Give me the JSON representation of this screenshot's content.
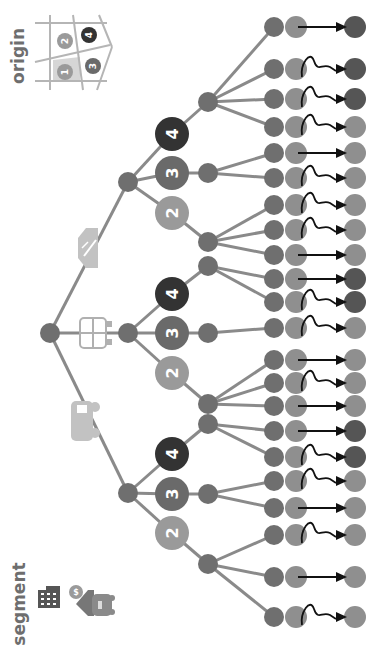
{
  "labels": {
    "origin": "origin",
    "segment": "segment"
  },
  "colors": {
    "edge": "#8a8a8a",
    "node_dark": "#6f6f6f",
    "node_mid": "#8f8f8f",
    "leaf_light": "#8f8f8f",
    "zone2": "#9a9a9a",
    "zone3": "#6a6a6a",
    "zone4": "#333333",
    "arrow": "#111111",
    "grid": "#b5b5b5",
    "zone1_fill": "#d6d6d6",
    "icon_light": "#c2c2c2",
    "icon_dark": "#555555"
  },
  "origin_legend": {
    "zones": [
      {
        "id": "1",
        "label": "1"
      },
      {
        "id": "2",
        "label": "2"
      },
      {
        "id": "3",
        "label": "3"
      },
      {
        "id": "4",
        "label": "4"
      }
    ]
  },
  "segment_icons": [
    "office-building-icon",
    "money-home-car-icon"
  ],
  "modes": [
    {
      "name": "car",
      "icon": "car-icon"
    },
    {
      "name": "bus",
      "icon": "bus-icon"
    },
    {
      "name": "train",
      "icon": "train-icon"
    }
  ],
  "zone_nodes": [
    {
      "label": "2",
      "x": 172,
      "y": 533,
      "shade": "zone2"
    },
    {
      "label": "3",
      "x": 172,
      "y": 494,
      "shade": "zone3"
    },
    {
      "label": "4",
      "x": 172,
      "y": 454,
      "shade": "zone4"
    },
    {
      "label": "2",
      "x": 172,
      "y": 373,
      "shade": "zone2"
    },
    {
      "label": "3",
      "x": 172,
      "y": 333,
      "shade": "zone3"
    },
    {
      "label": "4",
      "x": 172,
      "y": 294,
      "shade": "zone4"
    },
    {
      "label": "2",
      "x": 172,
      "y": 213,
      "shade": "zone2"
    },
    {
      "label": "3",
      "x": 172,
      "y": 173,
      "shade": "zone3"
    },
    {
      "label": "4",
      "x": 172,
      "y": 134,
      "shade": "zone4"
    }
  ],
  "leaves": [
    {
      "y": 27,
      "path": "straight",
      "dest": "zone4"
    },
    {
      "y": 69,
      "path": "wiggle",
      "dest": "zone4"
    },
    {
      "y": 99,
      "path": "wiggle",
      "dest": "zone4"
    },
    {
      "y": 127,
      "path": "wiggle",
      "dest": "zone2"
    },
    {
      "y": 153,
      "path": "straight",
      "dest": "zone2"
    },
    {
      "y": 178,
      "path": "wiggle",
      "dest": "zone2"
    },
    {
      "y": 205,
      "path": "wiggle",
      "dest": "zone2"
    },
    {
      "y": 230,
      "path": "wiggle",
      "dest": "zone2"
    },
    {
      "y": 255,
      "path": "straight",
      "dest": "zone2"
    },
    {
      "y": 279,
      "path": "straight",
      "dest": "zone4"
    },
    {
      "y": 302,
      "path": "wiggle",
      "dest": "zone4"
    },
    {
      "y": 328,
      "path": "wiggle",
      "dest": "zone2"
    },
    {
      "y": 360,
      "path": "straight",
      "dest": "zone2"
    },
    {
      "y": 383,
      "path": "wiggle",
      "dest": "zone2"
    },
    {
      "y": 406,
      "path": "straight",
      "dest": "zone2"
    },
    {
      "y": 431,
      "path": "straight",
      "dest": "zone4"
    },
    {
      "y": 457,
      "path": "wiggle",
      "dest": "zone4"
    },
    {
      "y": 481,
      "path": "wiggle",
      "dest": "zone2"
    },
    {
      "y": 508,
      "path": "straight",
      "dest": "zone2"
    },
    {
      "y": 535,
      "path": "wiggle",
      "dest": "zone2"
    },
    {
      "y": 577,
      "path": "straight",
      "dest": "zone2"
    },
    {
      "y": 617,
      "path": "wiggle",
      "dest": "zone2"
    }
  ]
}
